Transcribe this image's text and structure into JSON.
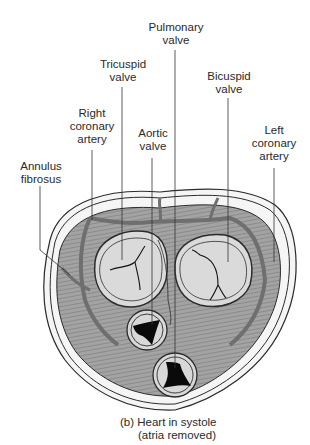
{
  "labels": {
    "pulmonary_valve": "Pulmonary\nvalve",
    "tricuspid_valve": "Tricuspid\nvalve",
    "bicuspid_valve": "Bicuspid\nvalve",
    "right_coronary_artery": "Right\ncoronary\nartery",
    "aortic_valve": "Aortic\nvalve",
    "left_coronary_artery": "Left\ncoronary\nartery",
    "annulus_fibrosus": "Annulus\nfibrosus"
  },
  "caption": {
    "line1": "(b) Heart in systole",
    "line2": "(atria removed)"
  },
  "colors": {
    "muscle": "#9a9a9a",
    "valve_fill": "#dcdcdc",
    "artery": "#7a7a7a",
    "outline": "#2b2b2b",
    "orifice": "#0a0a0a"
  }
}
